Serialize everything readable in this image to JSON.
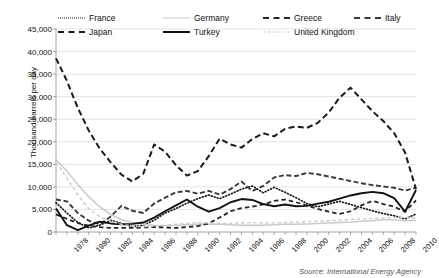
{
  "chart_data": {
    "type": "line",
    "title": "",
    "xlabel": "",
    "ylabel": "Thousand barrels per day",
    "source": "Source: International Energy Agency",
    "legend_position": "top",
    "grid": true,
    "ylim": [
      0,
      45000
    ],
    "ytick_labels": [
      "45,000",
      "40,000",
      "35,000",
      "30,000",
      "25,000",
      "20,000",
      "15,000",
      "10,000",
      "5,000",
      "0"
    ],
    "ytick_values": [
      45000,
      40000,
      35000,
      30000,
      25000,
      20000,
      15000,
      10000,
      5000,
      0
    ],
    "x": [
      1978,
      1979,
      1980,
      1981,
      1982,
      1983,
      1984,
      1985,
      1986,
      1987,
      1988,
      1989,
      1990,
      1991,
      1992,
      1993,
      1994,
      1995,
      1996,
      1997,
      1998,
      1999,
      2000,
      2001,
      2002,
      2003,
      2004,
      2005,
      2006,
      2007,
      2008,
      2009,
      2010,
      2011
    ],
    "xtick_labels": [
      "1978",
      "1980",
      "1982",
      "1984",
      "1986",
      "1988",
      "1990",
      "1992",
      "1994",
      "1996",
      "1998",
      "2000",
      "2002",
      "2004",
      "2006",
      "2008",
      "2010"
    ],
    "xtick_values": [
      1978,
      1980,
      1982,
      1984,
      1986,
      1988,
      1990,
      1992,
      1994,
      1996,
      1998,
      2000,
      2002,
      2004,
      2006,
      2008,
      2010
    ],
    "series": [
      {
        "name": "France",
        "style": "dotted",
        "color": "#1a1a1a",
        "values": [
          6500,
          4200,
          2100,
          900,
          1500,
          2600,
          1900,
          1200,
          1500,
          2600,
          4200,
          5200,
          6400,
          7400,
          8200,
          7400,
          8400,
          9500,
          10200,
          8700,
          9900,
          8800,
          7600,
          6300,
          5600,
          6200,
          6800,
          6100,
          5400,
          4700,
          4100,
          3600,
          2900,
          4000
        ]
      },
      {
        "name": "Germany",
        "style": "solid-light",
        "color": "#c9c9c9",
        "values": [
          16000,
          13500,
          10500,
          7800,
          5600,
          3900,
          2700,
          2100,
          1700,
          1500,
          1400,
          1500,
          1600,
          1700,
          1800,
          1700,
          1600,
          1500,
          1500,
          1500,
          1600,
          1700,
          1700,
          1800,
          1900,
          2000,
          2100,
          2200,
          2400,
          2500,
          2700,
          2700,
          2500,
          2600
        ]
      },
      {
        "name": "Greece",
        "style": "dashed",
        "color": "#262626",
        "values": [
          3900,
          2900,
          2000,
          1400,
          1100,
          900,
          900,
          900,
          1000,
          1100,
          1000,
          900,
          1100,
          1300,
          1900,
          3200,
          4600,
          5300,
          5600,
          6100,
          6900,
          7200,
          6600,
          5900,
          5100,
          4500,
          4000,
          4600,
          5900,
          6900,
          6200,
          5600,
          4500,
          7000
        ]
      },
      {
        "name": "Italy",
        "style": "dash-dot",
        "color": "#3a3a3a",
        "values": [
          7200,
          6800,
          4200,
          2500,
          1700,
          3400,
          5800,
          4700,
          4200,
          6300,
          7600,
          8800,
          9100,
          8500,
          9100,
          8300,
          9500,
          11200,
          9100,
          10200,
          12100,
          12600,
          12400,
          13100,
          12800,
          12300,
          11800,
          11300,
          10800,
          10400,
          10100,
          9800,
          9200,
          9800
        ]
      },
      {
        "name": "Japan",
        "style": "long-dash",
        "color": "#1a1a1a",
        "values": [
          38500,
          33500,
          27500,
          22500,
          18500,
          15500,
          12700,
          11200,
          12900,
          19400,
          17800,
          14800,
          12500,
          13500,
          16800,
          20700,
          19400,
          18700,
          20600,
          21900,
          21200,
          22900,
          23400,
          23100,
          24200,
          26500,
          29800,
          32000,
          29400,
          26800,
          24600,
          21900,
          17600,
          9500
        ]
      },
      {
        "name": "Turkey",
        "style": "solid",
        "color": "#111111",
        "values": [
          5200,
          1500,
          400,
          1400,
          2300,
          1900,
          1700,
          1800,
          2100,
          3200,
          4600,
          5900,
          7200,
          5600,
          4500,
          5300,
          6600,
          7300,
          7100,
          6200,
          5700,
          6100,
          5700,
          5800,
          6300,
          6700,
          7400,
          8100,
          8600,
          8900,
          8600,
          7500,
          4500,
          9300
        ]
      },
      {
        "name": "United Kingdom",
        "style": "light-dash",
        "color": "#cfcfcf",
        "values": [
          15500,
          12000,
          8200,
          5200,
          3400,
          2400,
          1700,
          1300,
          1200,
          1300,
          1500,
          1700,
          1900,
          2100,
          2000,
          1900,
          1900,
          2000,
          2100,
          2000,
          2000,
          2100,
          2200,
          2300,
          2400,
          2500,
          2600,
          2800,
          2900,
          3000,
          3100,
          3200,
          3300,
          3100
        ]
      }
    ]
  },
  "legend": {
    "row1": [
      {
        "label": "France",
        "swatch": "sw-dot"
      },
      {
        "label": "Germany",
        "swatch": "sw-solid-l"
      },
      {
        "label": "Greece",
        "swatch": "sw-dash"
      },
      {
        "label": "Italy",
        "swatch": "sw-dashdot"
      }
    ],
    "row2": [
      {
        "label": "Japan",
        "swatch": "sw-longdash"
      },
      {
        "label": "Turkey",
        "swatch": "sw-solid"
      },
      {
        "label": "United Kingdom",
        "swatch": "sw-lightdash"
      }
    ]
  }
}
